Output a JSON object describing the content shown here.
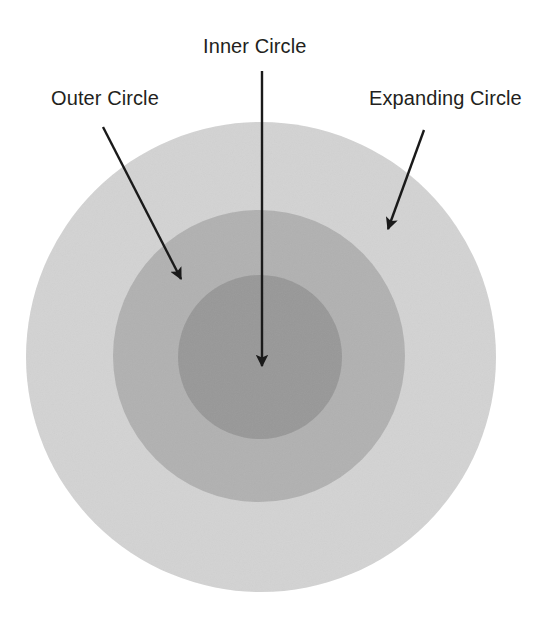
{
  "diagram": {
    "title_present": false,
    "background_color": "#ffffff",
    "canvas": {
      "width": 556,
      "height": 627
    },
    "shapes": [
      {
        "id": "outer-circle",
        "name": "Outer Circle",
        "kind": "circle",
        "color": "#d3d3d3",
        "center": {
          "x": 261,
          "y": 357
        },
        "radius": 235
      },
      {
        "id": "expanding-circle",
        "name": "Expanding Circle",
        "kind": "circle",
        "color": "#b1b1b1",
        "center": {
          "x": 259,
          "y": 356
        },
        "radius": 146
      },
      {
        "id": "inner-circle",
        "name": "Inner Circle",
        "kind": "circle",
        "color": "#989898",
        "center": {
          "x": 260,
          "y": 357
        },
        "radius": 82
      }
    ],
    "labels": [
      {
        "id": "label-inner",
        "text": "Inner Circle",
        "target": "inner-circle",
        "color": "#231f20"
      },
      {
        "id": "label-outer",
        "text": "Outer Circle",
        "target": "outer-circle",
        "color": "#231f20"
      },
      {
        "id": "label-expanding",
        "text": "Expanding Circle",
        "target": "expanding-circle",
        "color": "#231f20"
      }
    ],
    "annotations": [
      {
        "id": "arrow-inner",
        "from": {
          "x": 262,
          "y": 71
        },
        "to": {
          "x": 262,
          "y": 366
        },
        "color": "#1a1a1a",
        "label": "Inner Circle"
      },
      {
        "id": "arrow-outer",
        "from": {
          "x": 103,
          "y": 127
        },
        "to": {
          "x": 181,
          "y": 279
        },
        "color": "#1a1a1a",
        "label": "Outer Circle"
      },
      {
        "id": "arrow-expanding",
        "from": {
          "x": 424,
          "y": 130
        },
        "to": {
          "x": 388,
          "y": 229
        },
        "color": "#1a1a1a",
        "label": "Expanding Circle"
      }
    ]
  }
}
